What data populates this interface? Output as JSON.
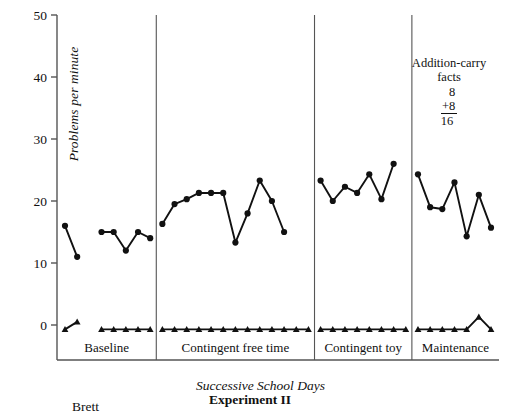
{
  "figure": {
    "experiment_title": "Experiment II",
    "subject": "Brett",
    "xaxis_title": "Successive School Days",
    "yaxis_title": "Problems per minute",
    "annotation": {
      "line1": "Addition-carry",
      "line2": "facts",
      "addend1": "8",
      "addend2": "+8",
      "sum": "16"
    }
  },
  "chart_data": {
    "type": "line",
    "title": "Experiment II",
    "subtitle": "Brett",
    "xlabel": "Successive School Days",
    "ylabel": "Problems per minute",
    "ylim": [
      0,
      50
    ],
    "ytick_labels": [
      "0",
      "10",
      "20",
      "30",
      "40",
      "50"
    ],
    "ytick_values": [
      0,
      10,
      20,
      30,
      40,
      50
    ],
    "grid": false,
    "legend_position": "none",
    "annotation_text": "Addition-carry facts  8 +8 16",
    "phases": [
      {
        "name": "Baseline",
        "x_start": 1,
        "x_end": 8,
        "segments": [
          {
            "x": [
              1,
              2
            ],
            "correct": [
              16,
              11
            ],
            "errors": [
              -0.7,
              0.5
            ]
          },
          {
            "x": [
              4,
              5,
              6,
              7,
              8
            ],
            "correct": [
              15,
              15,
              12,
              15,
              14
            ],
            "errors": [
              -0.7,
              -0.7,
              -0.7,
              -0.7,
              -0.7
            ]
          }
        ]
      },
      {
        "name": "Contingent free time",
        "x_start": 9,
        "x_end": 21,
        "segments": [
          {
            "x": [
              9,
              10,
              11,
              12,
              13,
              14,
              15,
              16,
              17,
              18,
              19,
              20,
              21
            ],
            "correct": [
              16.3,
              19.5,
              20.3,
              21.3,
              21.3,
              21.3,
              13.3,
              18,
              23.3,
              20,
              15,
              0,
              0
            ],
            "errors": [
              -0.7,
              -0.7,
              -0.7,
              -0.7,
              -0.7,
              -0.7,
              -0.7,
              -0.7,
              -0.7,
              -0.7,
              -0.7,
              -0.7,
              -0.7
            ]
          }
        ]
      },
      {
        "name": "Contingent toy",
        "x_start": 22,
        "x_end": 29,
        "segments": [
          {
            "x": [
              22,
              23,
              24,
              25,
              26,
              27,
              28,
              29
            ],
            "correct": [
              23.3,
              20,
              22.3,
              21.3,
              24.3,
              20.3,
              26,
              0
            ],
            "errors": [
              -0.7,
              -0.7,
              -0.7,
              -0.7,
              -0.7,
              -0.7,
              -0.7,
              -0.7
            ]
          }
        ]
      },
      {
        "name": "Maintenance",
        "x_start": 30,
        "x_end": 36,
        "segments": [
          {
            "x": [
              30,
              31,
              32,
              33,
              34,
              35,
              36
            ],
            "correct": [
              24.3,
              19,
              18.7,
              23,
              14.3,
              21,
              15.7
            ],
            "errors": [
              -0.7,
              -0.7,
              -0.7,
              -0.7,
              -0.7,
              1.3,
              -0.7
            ]
          }
        ]
      }
    ],
    "series": [
      {
        "name": "correct-problems-per-minute",
        "marker": "circle",
        "color": "#111111"
      },
      {
        "name": "errors-per-minute",
        "marker": "triangle",
        "color": "#111111"
      }
    ]
  },
  "axis": {
    "ticks": [
      {
        "label": "50",
        "value": 50
      },
      {
        "label": "40",
        "value": 40
      },
      {
        "label": "30",
        "value": 30
      },
      {
        "label": "20",
        "value": 20
      },
      {
        "label": "10",
        "value": 10
      },
      {
        "label": "0",
        "value": 0
      }
    ]
  },
  "phase_labels": [
    {
      "label": "Baseline"
    },
    {
      "label": "Contingent free time"
    },
    {
      "label": "Contingent toy"
    },
    {
      "label": "Maintenance"
    }
  ],
  "colors": {
    "ink": "#111111",
    "axis": "#555555",
    "background": "#ffffff"
  }
}
